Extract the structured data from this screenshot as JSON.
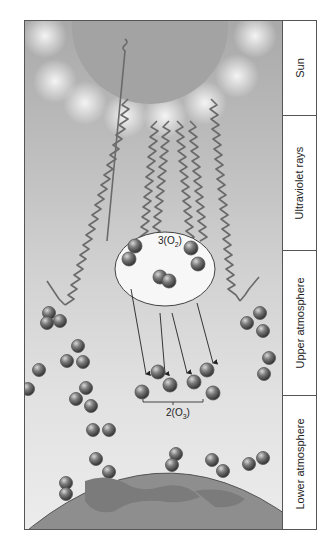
{
  "labels": {
    "sun": "Sun",
    "uv": "Ultraviolet rays",
    "upper": "Upper atmosphere",
    "lower": "Lower atmosphere"
  },
  "formulas": {
    "oxygen_coef": "3(O",
    "oxygen_sub": "2",
    "oxygen_close": ")",
    "ozone_coef": "2(O",
    "ozone_sub": "3",
    "ozone_close": ")"
  },
  "colors": {
    "sun": "#9a9a9a",
    "molecule": "#6d6d6d",
    "ray": "#6a6a6a",
    "earth": "#8e8e8e",
    "border": "#555555"
  }
}
